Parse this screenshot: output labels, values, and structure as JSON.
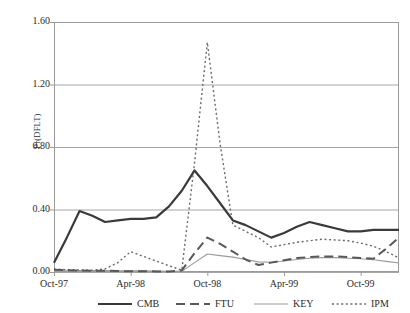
{
  "chart_data": {
    "type": "line",
    "title": "",
    "xlabel": "",
    "ylabel": "Pr(DFLT)",
    "ylim": [
      0.0,
      1.6
    ],
    "yticks": [
      "0.00",
      "0.40",
      "0.80",
      "1.20",
      "1.60"
    ],
    "ytick_values": [
      0.0,
      0.4,
      0.8,
      1.2,
      1.6
    ],
    "grid": true,
    "legend_position": "bottom",
    "x": [
      "Oct-97",
      "Nov-97",
      "Dec-97",
      "Jan-98",
      "Feb-98",
      "Mar-98",
      "Apr-98",
      "May-98",
      "Jun-98",
      "Jul-98",
      "Aug-98",
      "Sep-98",
      "Oct-98",
      "Nov-98",
      "Dec-98",
      "Jan-99",
      "Feb-99",
      "Mar-99",
      "Apr-99",
      "May-99",
      "Jun-99",
      "Jul-99",
      "Aug-99",
      "Sep-99",
      "Oct-99",
      "Nov-99",
      "Dec-99",
      "Jan-00"
    ],
    "xticks": [
      "Oct-97",
      "Apr-98",
      "Oct-98",
      "Apr-99",
      "Oct-99"
    ],
    "xtick_indices": [
      0,
      6,
      12,
      18,
      24
    ],
    "series": [
      {
        "name": "CMB",
        "style": "solid",
        "color": "#3a3a3a",
        "width": 2.2,
        "values": [
          0.06,
          0.22,
          0.39,
          0.36,
          0.32,
          0.33,
          0.34,
          0.34,
          0.35,
          0.42,
          0.52,
          0.65,
          0.55,
          0.44,
          0.33,
          0.3,
          0.26,
          0.22,
          0.25,
          0.29,
          0.32,
          0.3,
          0.28,
          0.26,
          0.26,
          0.27,
          0.27,
          0.27
        ]
      },
      {
        "name": "FTU",
        "style": "dashed",
        "color": "#585858",
        "width": 2.0,
        "values": [
          0.015,
          0.012,
          0.01,
          0.008,
          0.008,
          0.006,
          0.005,
          0.005,
          0.004,
          0.004,
          0.01,
          0.12,
          0.22,
          0.18,
          0.13,
          0.08,
          0.045,
          0.06,
          0.075,
          0.09,
          0.095,
          0.1,
          0.1,
          0.095,
          0.09,
          0.085,
          0.15,
          0.22
        ]
      },
      {
        "name": "KEY",
        "style": "solid-thin",
        "color": "#9a9a9a",
        "width": 1.1,
        "values": [
          0.012,
          0.011,
          0.01,
          0.01,
          0.009,
          0.008,
          0.007,
          0.007,
          0.006,
          0.005,
          0.004,
          0.06,
          0.115,
          0.105,
          0.095,
          0.08,
          0.065,
          0.062,
          0.07,
          0.08,
          0.088,
          0.092,
          0.092,
          0.088,
          0.085,
          0.078,
          0.068,
          0.058
        ]
      },
      {
        "name": "IPM",
        "style": "dotted",
        "color": "#6a6a6a",
        "width": 1.4,
        "values": [
          0.018,
          0.015,
          0.013,
          0.012,
          0.02,
          0.06,
          0.13,
          0.1,
          0.07,
          0.04,
          0.012,
          0.7,
          1.47,
          0.82,
          0.3,
          0.26,
          0.22,
          0.16,
          0.175,
          0.19,
          0.2,
          0.21,
          0.205,
          0.2,
          0.185,
          0.165,
          0.13,
          0.09
        ]
      }
    ],
    "legend": [
      {
        "label": "CMB"
      },
      {
        "label": "FTU"
      },
      {
        "label": "KEY"
      },
      {
        "label": "IPM"
      }
    ]
  },
  "plot": {
    "left": 54,
    "right": 399,
    "top": 22,
    "bottom": 272,
    "border_color": "#9b9b9b",
    "grid_color": "#a6a6a6",
    "background": "#ffffff"
  }
}
